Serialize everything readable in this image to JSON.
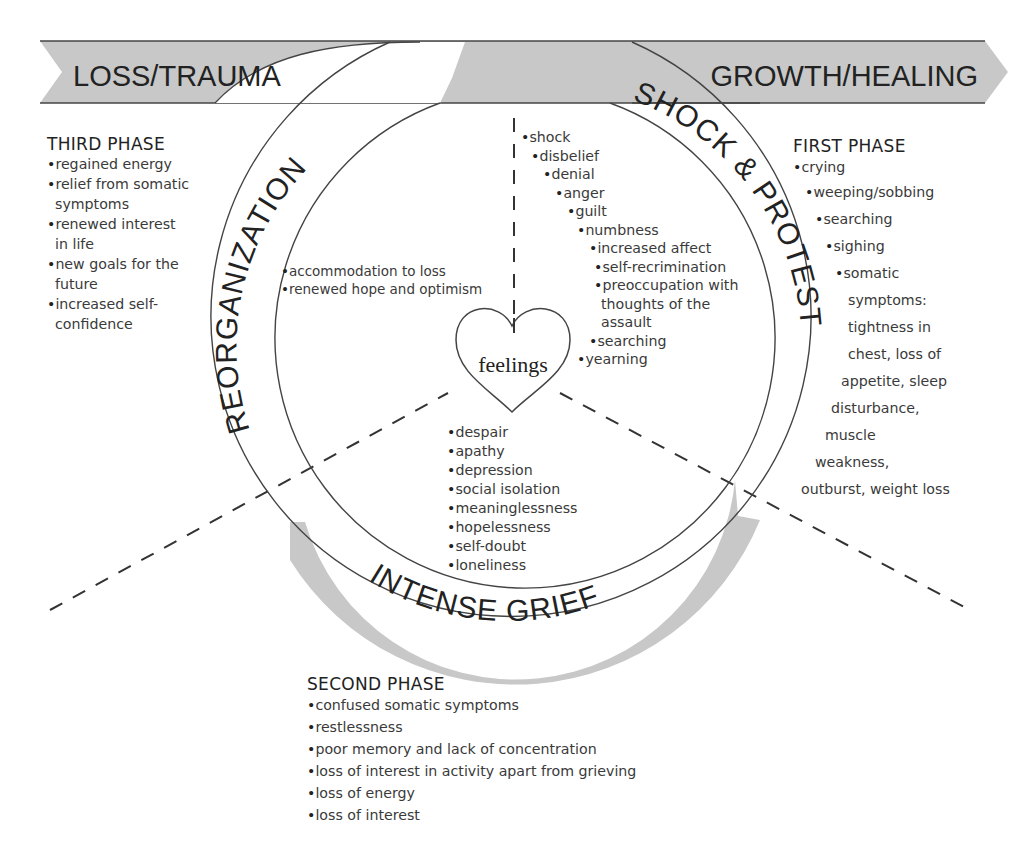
{
  "header_cut_text": "the dynamic process of grief",
  "arrow_band": {
    "left_label": "LOSS/TRAUMA",
    "right_label": "GROWTH/HEALING",
    "fill_color": "#c8c8c8"
  },
  "ring": {
    "segments": [
      {
        "id": "reorganization",
        "label": "REORGANIZATION"
      },
      {
        "id": "shock-protest",
        "label": "SHOCK & PROTEST"
      },
      {
        "id": "intense-grief",
        "label": "INTENSE GRIEF"
      }
    ],
    "fill_color": "#c8c8c8"
  },
  "center": {
    "label": "feelings"
  },
  "inner_lists": {
    "reorganization": [
      "accommodation to loss",
      "renewed hope and optimism"
    ],
    "shock_protest": [
      "shock",
      "disbelief",
      "denial",
      "anger",
      "guilt",
      "numbness",
      "increased affect",
      "self-recrimination",
      "preoccupation with",
      "thoughts of the",
      "assault",
      "searching",
      "yearning"
    ],
    "intense_grief": [
      "despair",
      "apathy",
      "depression",
      "social isolation",
      "meaninglessness",
      "hopelessness",
      "self-doubt",
      "loneliness"
    ]
  },
  "phases": {
    "third": {
      "title": "THIRD PHASE",
      "items": [
        "regained energy",
        "relief from somatic",
        "symptoms",
        "renewed interest",
        "in life",
        "new goals for the",
        "future",
        "increased self-",
        "confidence"
      ]
    },
    "first": {
      "title": "FIRST PHASE",
      "items": [
        "crying",
        "weeping/sobbing",
        "searching",
        "sighing",
        "somatic",
        "symptoms:",
        "tightness in",
        "chest, loss of",
        "appetite, sleep",
        "disturbance,",
        "muscle",
        "weakness,",
        "outburst, weight loss"
      ]
    },
    "second": {
      "title": "SECOND PHASE",
      "items": [
        "confused somatic symptoms",
        "restlessness",
        "poor memory and lack of concentration",
        "loss of interest in activity apart from grieving",
        "loss of energy",
        "loss of interest"
      ]
    }
  }
}
